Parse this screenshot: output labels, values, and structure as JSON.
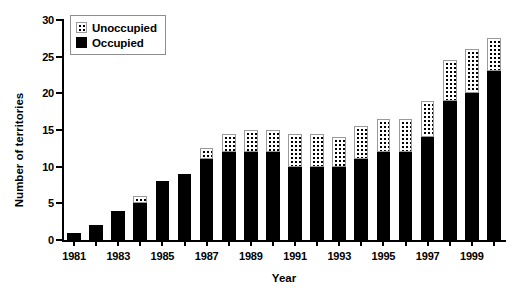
{
  "chart_data": {
    "type": "bar",
    "stacked": true,
    "title": "",
    "xlabel": "Year",
    "ylabel": "Number of territories",
    "ylim": [
      0,
      30
    ],
    "ytick_step": 5,
    "yticks": [
      0,
      5,
      10,
      15,
      20,
      25,
      30
    ],
    "grid": false,
    "legend_position": "top-left",
    "categories": [
      "1981",
      "1982",
      "1983",
      "1984",
      "1985",
      "1986",
      "1987",
      "1988",
      "1989",
      "1990",
      "1991",
      "1992",
      "1993",
      "1994",
      "1995",
      "1996",
      "1997",
      "1998",
      "1999",
      "2000"
    ],
    "xtick_labels": [
      "1981",
      "",
      "1983",
      "",
      "1985",
      "",
      "1987",
      "",
      "1989",
      "",
      "1991",
      "",
      "1993",
      "",
      "1995",
      "",
      "1997",
      "",
      "1999",
      ""
    ],
    "xtick_labels_shown": [
      "1981",
      "1983",
      "1985",
      "1987",
      "1989",
      "1991",
      "1993",
      "1995",
      "1997",
      "1999"
    ],
    "series": [
      {
        "name": "Occupied",
        "color": "#000000",
        "values": [
          1,
          2,
          4,
          5,
          8,
          9,
          11,
          12,
          12,
          12,
          10,
          10,
          10,
          11,
          12,
          12,
          14,
          19,
          20,
          23
        ]
      },
      {
        "name": "Unoccupied",
        "color": "#ffffff",
        "pattern": "dotted",
        "values": [
          0,
          0,
          0,
          1,
          0,
          0,
          1.5,
          2.5,
          3,
          3,
          4.5,
          4.5,
          4,
          4.5,
          4.5,
          4.5,
          5,
          5.5,
          6,
          4.5
        ]
      }
    ],
    "totals": [
      1,
      2,
      4,
      6,
      8,
      9,
      12.5,
      14.5,
      15,
      15,
      14.5,
      14.5,
      14,
      15.5,
      16.5,
      16.5,
      19,
      24.5,
      26,
      27.5
    ]
  },
  "legend": {
    "entries": [
      {
        "label": "Unoccupied",
        "swatch": "dotted-white"
      },
      {
        "label": "Occupied",
        "swatch": "solid-black"
      }
    ]
  },
  "axes": {
    "y_title": "Number of territories",
    "x_title": "Year"
  }
}
